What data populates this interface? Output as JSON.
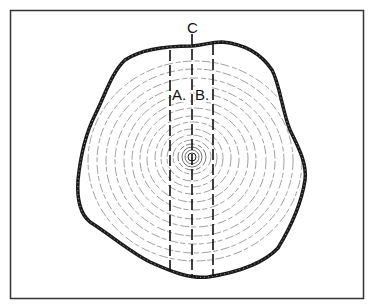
{
  "diagram": {
    "labels": {
      "a": "A.",
      "b": "B.",
      "c": "C"
    },
    "colors": {
      "outline": "#1a1a1a",
      "rings": "#6a6a6a",
      "frame": "#333333",
      "background": "#ffffff"
    },
    "sampling_lines": [
      {
        "id": "A",
        "x": 170
      },
      {
        "id": "C",
        "x": 192
      },
      {
        "id": "B",
        "x": 213
      }
    ],
    "pith": {
      "x": 192,
      "y": 157
    }
  }
}
